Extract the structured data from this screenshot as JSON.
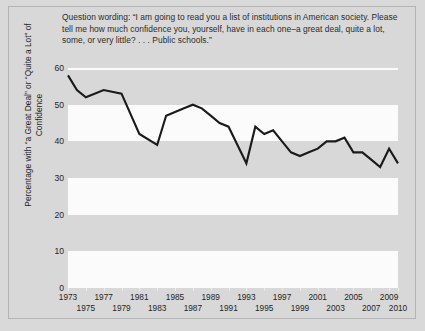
{
  "caption": "Question wording: “I am going to read you a list of institutions in American society. Please tell me how much confidence you, yourself, have in each one–a great deal, quite a lot, some, or very little? . . . Public schools.”",
  "colors": {
    "figure_background": "#d9d9d9",
    "plot_band": "#fbfbfb",
    "line": "#1a1a1a",
    "text": "#1f1f1f",
    "frame_border": "#b4b4b4"
  },
  "chart_data": {
    "type": "line",
    "title": "",
    "xlabel": "",
    "ylabel": "Percentage with “a Great Deal” or “Quite a Lot” of Confidence",
    "ylim": [
      0,
      60
    ],
    "yticks": [
      0,
      10,
      20,
      30,
      40,
      50,
      60
    ],
    "xlim": [
      1973,
      2010
    ],
    "grid": false,
    "legend": "none",
    "xticks_row_a": [
      1973,
      1977,
      1981,
      1985,
      1989,
      1993,
      1997,
      2001,
      2005,
      2009
    ],
    "xticks_row_b": [
      1975,
      1979,
      1983,
      1987,
      1991,
      1995,
      1999,
      2003,
      2007,
      2010
    ],
    "x": [
      1973,
      1974,
      1975,
      1977,
      1979,
      1981,
      1983,
      1984,
      1985,
      1986,
      1987,
      1988,
      1989,
      1990,
      1991,
      1992,
      1993,
      1994,
      1995,
      1996,
      1997,
      1998,
      1999,
      2000,
      2001,
      2002,
      2003,
      2004,
      2005,
      2006,
      2007,
      2008,
      2009,
      2010
    ],
    "values": [
      58,
      54,
      52,
      54,
      53,
      42,
      39,
      47,
      48,
      49,
      50,
      49,
      47,
      45,
      44,
      39,
      34,
      44,
      42,
      43,
      40,
      37,
      36,
      37,
      38,
      40,
      40,
      41,
      37,
      37,
      35,
      33,
      38,
      34
    ],
    "series": [
      {
        "name": "Confidence in public schools",
        "values": [
          58,
          54,
          52,
          54,
          53,
          42,
          39,
          47,
          48,
          49,
          50,
          49,
          47,
          45,
          44,
          39,
          34,
          44,
          42,
          43,
          40,
          37,
          36,
          37,
          38,
          40,
          40,
          41,
          37,
          37,
          35,
          33,
          38,
          34
        ]
      }
    ]
  }
}
